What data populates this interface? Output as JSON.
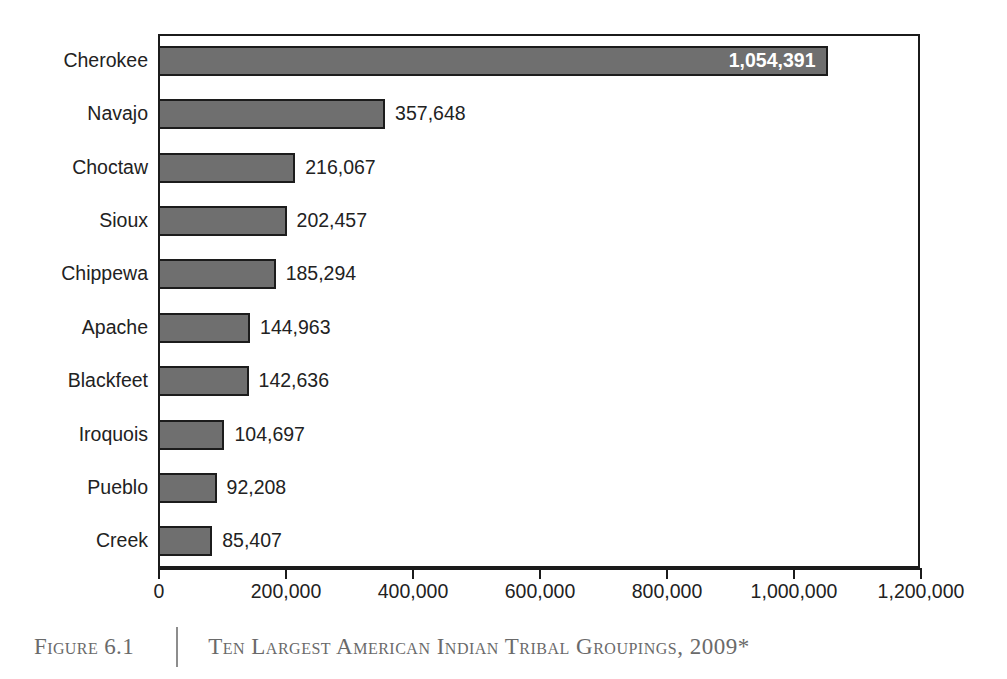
{
  "caption": {
    "figure_number": "Figure 6.1",
    "title": "Ten Largest American Indian Tribal Groupings, 2009*"
  },
  "colors": {
    "bar_fill": "#6f6f6f",
    "bar_border": "#1c1c1c",
    "axis": "#1b1b1b",
    "text": "#222222",
    "inside_label": "#ffffff",
    "caption_text": "#6a6a6a",
    "background": "#ffffff"
  },
  "chart_data": {
    "type": "bar",
    "orientation": "horizontal",
    "title": "Ten Largest American Indian Tribal Groupings, 2009*",
    "xlabel": "",
    "ylabel": "",
    "xlim": [
      0,
      1200000
    ],
    "grid": false,
    "legend": null,
    "axis_ticks": [
      "0",
      "200,000",
      "400,000",
      "600,000",
      "800,000",
      "1,000,000",
      "1,200,000"
    ],
    "axis_tick_values": [
      0,
      200000,
      400000,
      600000,
      800000,
      1000000,
      1200000
    ],
    "categories": [
      "Cherokee",
      "Navajo",
      "Choctaw",
      "Sioux",
      "Chippewa",
      "Apache",
      "Blackfeet",
      "Iroquois",
      "Pueblo",
      "Creek"
    ],
    "values": [
      1054391,
      357648,
      216067,
      202457,
      185294,
      144963,
      142636,
      104697,
      92208,
      85407
    ],
    "value_labels": [
      "1,054,391",
      "357,648",
      "216,067",
      "202,457",
      "185,294",
      "144,963",
      "142,636",
      "104,697",
      "92,208",
      "85,407"
    ],
    "label_placement": [
      "inside",
      "outside",
      "outside",
      "outside",
      "outside",
      "outside",
      "outside",
      "outside",
      "outside",
      "outside"
    ]
  }
}
